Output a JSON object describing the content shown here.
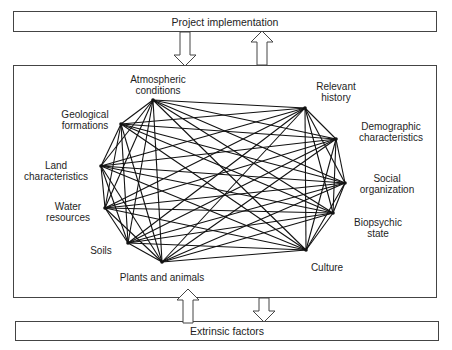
{
  "top_bar": {
    "label": "Project implementation"
  },
  "bottom_bar": {
    "label": "Extrinsic factors"
  },
  "nodes": [
    {
      "id": "atmospheric",
      "label_lines": [
        "Atmospheric",
        "conditions"
      ],
      "x": 153,
      "y": 100
    },
    {
      "id": "geological",
      "label_lines": [
        "Geological",
        "formations"
      ],
      "x": 121,
      "y": 124
    },
    {
      "id": "land",
      "label_lines": [
        "Land",
        "characteristics"
      ],
      "x": 101,
      "y": 166
    },
    {
      "id": "water",
      "label_lines": [
        "Water",
        "resources"
      ],
      "x": 105,
      "y": 208
    },
    {
      "id": "soils",
      "label_lines": [
        "Soils"
      ],
      "x": 128,
      "y": 243
    },
    {
      "id": "plants",
      "label_lines": [
        "Plants and animals"
      ],
      "x": 162,
      "y": 262
    },
    {
      "id": "culture",
      "label_lines": [
        "Culture"
      ],
      "x": 306,
      "y": 250
    },
    {
      "id": "biopsychic",
      "label_lines": [
        "Biopsychic",
        "state"
      ],
      "x": 333,
      "y": 213
    },
    {
      "id": "social",
      "label_lines": [
        "Social",
        "organization"
      ],
      "x": 345,
      "y": 183
    },
    {
      "id": "demographic",
      "label_lines": [
        "Demographic",
        "characteristics"
      ],
      "x": 336,
      "y": 139
    },
    {
      "id": "history",
      "label_lines": [
        "Relevant",
        "history"
      ],
      "x": 305,
      "y": 108
    }
  ],
  "edges": "complete-graph: every node connected to every other node",
  "arrows": [
    {
      "id": "top-down",
      "direction": "down",
      "from": "Project implementation",
      "to": "main system"
    },
    {
      "id": "top-up",
      "direction": "up",
      "from": "main system",
      "to": "Project implementation"
    },
    {
      "id": "bottom-up",
      "direction": "up",
      "from": "Extrinsic factors",
      "to": "main system"
    },
    {
      "id": "bottom-down",
      "direction": "down",
      "from": "main system",
      "to": "Extrinsic factors"
    }
  ]
}
